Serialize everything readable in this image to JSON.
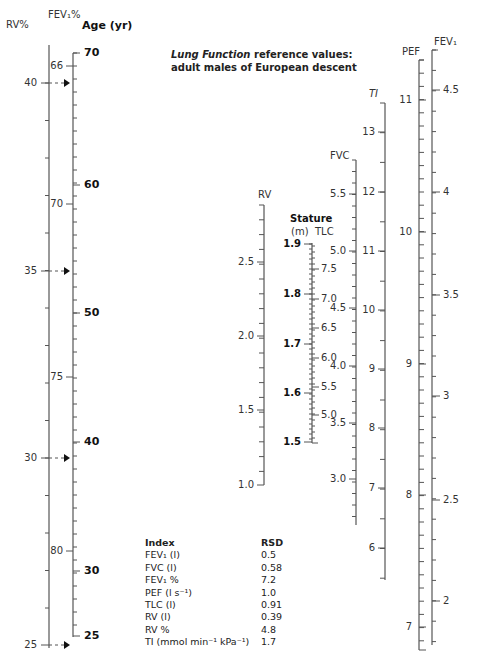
{
  "title": {
    "italic": "Lung Function",
    "line1_rest": " reference values:",
    "line2": "adult males of European descent"
  },
  "scales": {
    "rv_pct": {
      "label": "RV%",
      "ticks": [
        {
          "v": "40",
          "y": 83
        },
        {
          "v": "35",
          "y": 271
        },
        {
          "v": "30",
          "y": 458
        },
        {
          "v": "25",
          "y": 645
        }
      ]
    },
    "fev1_pct": {
      "label": "FEV₁%",
      "ticks": [
        {
          "v": "66",
          "y": 66
        },
        {
          "v": "70",
          "y": 204
        },
        {
          "v": "75",
          "y": 377
        },
        {
          "v": "80",
          "y": 551
        }
      ]
    },
    "age": {
      "label": "Age (yr)",
      "ticks": [
        {
          "v": "70",
          "y": 53
        },
        {
          "v": "60",
          "y": 185
        },
        {
          "v": "50",
          "y": 313
        },
        {
          "v": "40",
          "y": 442
        },
        {
          "v": "30",
          "y": 571
        },
        {
          "v": "25",
          "y": 636
        }
      ]
    },
    "rv": {
      "label": "RV",
      "ticks": [
        {
          "v": "2.5",
          "y": 262
        },
        {
          "v": "2.0",
          "y": 336
        },
        {
          "v": "1.5",
          "y": 410
        },
        {
          "v": "1.0",
          "y": 485
        }
      ]
    },
    "stature": {
      "label": "Stature",
      "unit": "(m)",
      "ticks": [
        {
          "v": "1.9",
          "y": 244
        },
        {
          "v": "1.8",
          "y": 294
        },
        {
          "v": "1.7",
          "y": 344
        },
        {
          "v": "1.6",
          "y": 393
        },
        {
          "v": "1.5",
          "y": 442
        }
      ]
    },
    "tlc": {
      "label": "TLC",
      "ticks": [
        {
          "v": "7.5",
          "y": 269
        },
        {
          "v": "7.0",
          "y": 299
        },
        {
          "v": "6.5",
          "y": 328
        },
        {
          "v": "6.0",
          "y": 358
        },
        {
          "v": "5.5",
          "y": 387
        },
        {
          "v": "5.0",
          "y": 415
        }
      ]
    },
    "fvc": {
      "label": "FVC",
      "ticks": [
        {
          "v": "5.5",
          "y": 194
        },
        {
          "v": "5.0",
          "y": 251
        },
        {
          "v": "4.5",
          "y": 308
        },
        {
          "v": "4.0",
          "y": 366
        },
        {
          "v": "3.5",
          "y": 423
        },
        {
          "v": "3.0",
          "y": 479
        }
      ]
    },
    "ti": {
      "label": "TI",
      "ticks": [
        {
          "v": "13",
          "y": 132
        },
        {
          "v": "12",
          "y": 192
        },
        {
          "v": "11",
          "y": 251
        },
        {
          "v": "10",
          "y": 310
        },
        {
          "v": "9",
          "y": 369
        },
        {
          "v": "8",
          "y": 428
        },
        {
          "v": "7",
          "y": 488
        },
        {
          "v": "6",
          "y": 548
        }
      ]
    },
    "pef": {
      "label": "PEF",
      "ticks": [
        {
          "v": "11",
          "y": 100
        },
        {
          "v": "10",
          "y": 232
        },
        {
          "v": "9",
          "y": 364
        },
        {
          "v": "8",
          "y": 495
        },
        {
          "v": "7",
          "y": 627
        }
      ]
    },
    "fev1": {
      "label": "FEV₁",
      "ticks": [
        {
          "v": "4.5",
          "y": 90
        },
        {
          "v": "4",
          "y": 192
        },
        {
          "v": "3.5",
          "y": 295
        },
        {
          "v": "3",
          "y": 396
        },
        {
          "v": "2.5",
          "y": 500
        },
        {
          "v": "2",
          "y": 601
        }
      ]
    }
  },
  "rsd_table": {
    "header": {
      "index": "Index",
      "rsd": "RSD"
    },
    "rows": [
      {
        "index": "FEV₁ (l)",
        "rsd": "0.5"
      },
      {
        "index": "FVC (l)",
        "rsd": "0.58"
      },
      {
        "index": "FEV₁ %",
        "rsd": "7.2"
      },
      {
        "index": "PEF (l s⁻¹)",
        "rsd": "1.0"
      },
      {
        "index": "TLC (l)",
        "rsd": "0.91"
      },
      {
        "index": "RV (l)",
        "rsd": "0.39"
      },
      {
        "index": "RV %",
        "rsd": "4.8"
      },
      {
        "index": "TI (mmol min⁻¹ kPa⁻¹)",
        "rsd": "1.7"
      }
    ]
  },
  "colors": {
    "line": "#555555",
    "text": "#222222"
  }
}
